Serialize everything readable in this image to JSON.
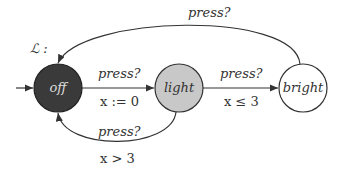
{
  "automaton": {
    "name": "ℒ :",
    "states": [
      {
        "id": "off",
        "label": "off",
        "fill": "#3a3a3a",
        "text_color": "#dddddd",
        "initial": true
      },
      {
        "id": "light",
        "label": "light",
        "fill": "#c8c8c8",
        "text_color": "#333333",
        "initial": false
      },
      {
        "id": "bright",
        "label": "bright",
        "fill": "#ffffff",
        "text_color": "#333333",
        "initial": false
      }
    ],
    "transitions": [
      {
        "from": "off",
        "to": "light",
        "action": "press?",
        "update": "x := 0"
      },
      {
        "from": "light",
        "to": "bright",
        "action": "press?",
        "guard": "x ≤ 3"
      },
      {
        "from": "light",
        "to": "off",
        "action": "press?",
        "guard": "x > 3"
      },
      {
        "from": "bright",
        "to": "off",
        "action": "press?"
      }
    ]
  }
}
